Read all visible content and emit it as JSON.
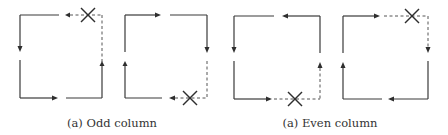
{
  "figure": {
    "captions": [
      {
        "id": "odd",
        "text": "(a) Odd column"
      },
      {
        "id": "even",
        "text": "(a) Even column"
      }
    ],
    "panels": [
      {
        "group": "odd",
        "index": 1,
        "direction": "counter-clockwise",
        "blocked_corner": "top-right",
        "blocked_edges": [
          "top-right-half",
          "right-upper-half"
        ]
      },
      {
        "group": "odd",
        "index": 2,
        "direction": "clockwise",
        "blocked_corner": "bottom-right",
        "blocked_edges": [
          "right-lower-half",
          "bottom-right-half"
        ]
      },
      {
        "group": "even",
        "index": 1,
        "direction": "counter-clockwise",
        "blocked_corner": "bottom-right",
        "blocked_edges": [
          "bottom-right-half",
          "right-lower-half"
        ]
      },
      {
        "group": "even",
        "index": 2,
        "direction": "clockwise",
        "blocked_corner": "top-right",
        "blocked_edges": [
          "top-right-half",
          "right-upper-half"
        ]
      }
    ],
    "legend": {
      "solid_line": "valid path",
      "dashed_line": "blocked path",
      "cross_mark": "faulty node"
    },
    "colors": {
      "stroke": "#3a3a3a",
      "dashed": "#555555"
    }
  }
}
